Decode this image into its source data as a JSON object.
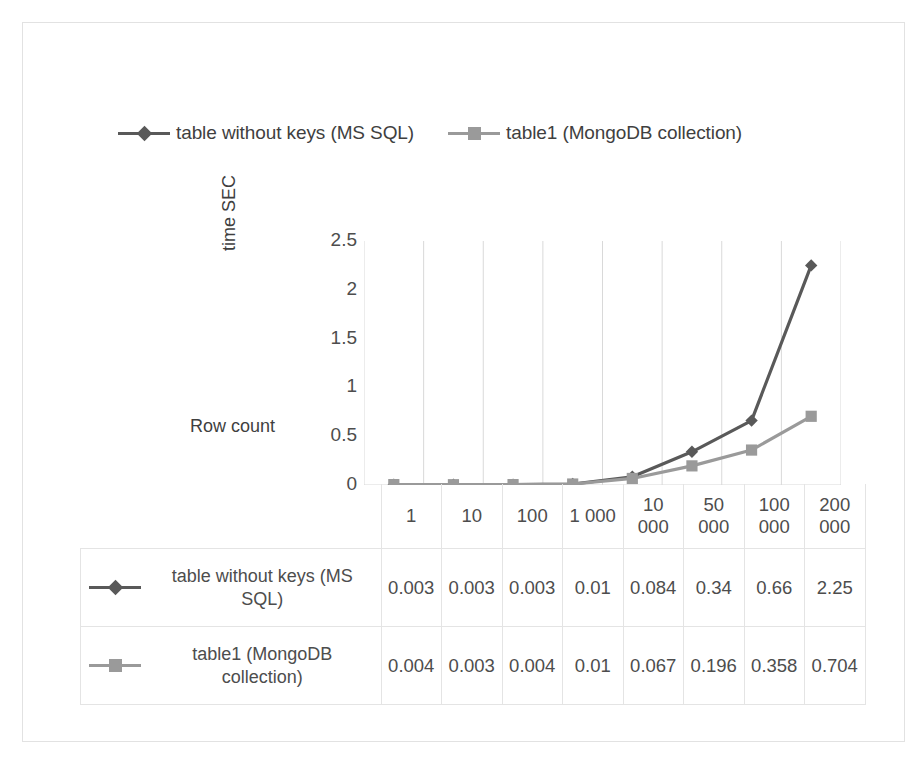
{
  "chart_data": {
    "type": "line",
    "title": "",
    "xlabel": "Row count",
    "ylabel": "time SEC",
    "categories": [
      "1",
      "10",
      "100",
      "1 000",
      "10 000",
      "50 000",
      "100 000",
      "200 000"
    ],
    "ylim": [
      0,
      2.5
    ],
    "yticks": [
      "0",
      "0.5",
      "1",
      "1.5",
      "2",
      "2.5"
    ],
    "ytick_values": [
      0,
      0.5,
      1,
      1.5,
      2,
      2.5
    ],
    "grid": "vertical",
    "legend_position": "top",
    "series": [
      {
        "name": "table without keys (MS SQL)",
        "marker": "diamond",
        "color": "#595959",
        "values": [
          0.003,
          0.003,
          0.003,
          0.01,
          0.084,
          0.34,
          0.66,
          2.25
        ],
        "labels": [
          "0.003",
          "0.003",
          "0.003",
          "0.01",
          "0.084",
          "0.34",
          "0.66",
          "2.25"
        ]
      },
      {
        "name": "table1 (MongoDB collection)",
        "marker": "square",
        "color": "#9a9a9a",
        "values": [
          0.004,
          0.003,
          0.004,
          0.01,
          0.067,
          0.196,
          0.358,
          0.704
        ],
        "labels": [
          "0.004",
          "0.003",
          "0.004",
          "0.01",
          "0.067",
          "0.196",
          "0.358",
          "0.704"
        ]
      }
    ]
  },
  "legend": {
    "items": [
      {
        "label": "table without keys (MS SQL)",
        "marker": "diamond-marker",
        "color": "#595959"
      },
      {
        "label": "table1 (MongoDB collection)",
        "marker": "square-marker",
        "color": "#9a9a9a"
      }
    ]
  },
  "colors": {
    "series_dark": "#595959",
    "series_light": "#9a9a9a",
    "gridline": "#d9d9d9",
    "table_border": "#e4e4e4",
    "frame_border": "#e2e2e2",
    "text": "#4d4d4d"
  }
}
